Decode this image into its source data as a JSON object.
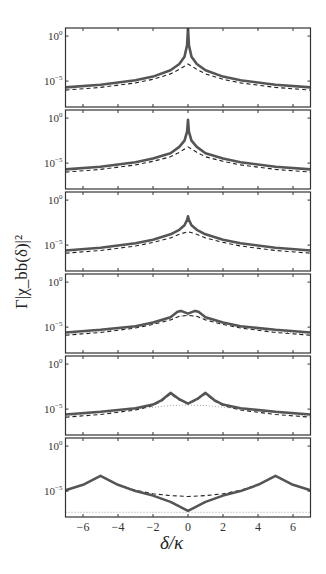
{
  "chart_data": {
    "type": "line",
    "layout": "6 vertically stacked panels sharing x-axis",
    "xlabel": "δ/κ",
    "ylabel": "Γ|χ_bb(δ)|²",
    "xlim": [
      -7,
      7
    ],
    "xticks": [
      -6,
      -4,
      -2,
      0,
      2,
      4,
      6
    ],
    "xtick_labels": [
      "−6",
      "−4",
      "−2",
      "0",
      "2",
      "4",
      "6"
    ],
    "yscale": "log",
    "ylim": [
      1e-08,
      10
    ],
    "yticks": [
      1,
      1e-05
    ],
    "ytick_labels": [
      {
        "base": "10",
        "exp": "0"
      },
      {
        "base": "10",
        "exp": "−5"
      }
    ],
    "grid": false,
    "legend": null,
    "series_styles": {
      "solid": {
        "color": "#555555",
        "width": 2.6,
        "dash": ""
      },
      "dashed": {
        "color": "#222222",
        "width": 1.1,
        "dash": "4,3"
      },
      "dotted": {
        "color": "#999999",
        "width": 0.9,
        "dash": "1,2"
      }
    },
    "panels": [
      {
        "name": "panel-1",
        "series": [
          {
            "name": "solid",
            "x": [
              -7,
              -5,
              -3,
              -2,
              -1,
              -0.5,
              -0.2,
              -0.05,
              0,
              0.05,
              0.2,
              0.5,
              1,
              2,
              3,
              5,
              7
            ],
            "log10_y": [
              -5.7,
              -5.4,
              -4.9,
              -4.5,
              -3.8,
              -3.1,
              -2.3,
              -1.0,
              0.9,
              -1.0,
              -2.3,
              -3.1,
              -3.8,
              -4.5,
              -4.9,
              -5.4,
              -5.7
            ]
          },
          {
            "name": "dashed",
            "x": [
              -7,
              -5,
              -3,
              -2,
              -1,
              -0.5,
              0,
              0.5,
              1,
              2,
              3,
              5,
              7
            ],
            "log10_y": [
              -6.0,
              -5.7,
              -5.2,
              -4.8,
              -4.2,
              -3.7,
              -3.1,
              -3.7,
              -4.2,
              -4.8,
              -5.2,
              -5.7,
              -6.0
            ]
          }
        ]
      },
      {
        "name": "panel-2",
        "series": [
          {
            "name": "solid",
            "x": [
              -7,
              -5,
              -3,
              -2,
              -1,
              -0.5,
              -0.2,
              -0.05,
              0,
              0.05,
              0.2,
              0.5,
              1,
              2,
              3,
              5,
              7
            ],
            "log10_y": [
              -5.7,
              -5.4,
              -4.9,
              -4.5,
              -3.9,
              -3.2,
              -2.5,
              -1.5,
              -0.2,
              -1.5,
              -2.5,
              -3.2,
              -3.9,
              -4.5,
              -4.9,
              -5.4,
              -5.7
            ]
          },
          {
            "name": "dashed",
            "x": [
              -7,
              -5,
              -3,
              -2,
              -1,
              -0.5,
              0,
              0.5,
              1,
              2,
              3,
              5,
              7
            ],
            "log10_y": [
              -6.0,
              -5.7,
              -5.2,
              -4.8,
              -4.3,
              -3.8,
              -3.2,
              -3.8,
              -4.3,
              -4.8,
              -5.2,
              -5.7,
              -6.0
            ]
          }
        ]
      },
      {
        "name": "panel-3",
        "series": [
          {
            "name": "solid",
            "x": [
              -7,
              -5,
              -3,
              -2,
              -1,
              -0.5,
              -0.2,
              -0.05,
              0,
              0.05,
              0.2,
              0.5,
              1,
              2,
              3,
              5,
              7
            ],
            "log10_y": [
              -5.6,
              -5.3,
              -4.8,
              -4.4,
              -3.8,
              -3.3,
              -2.8,
              -2.2,
              -1.8,
              -2.2,
              -2.8,
              -3.3,
              -3.8,
              -4.4,
              -4.8,
              -5.3,
              -5.6
            ]
          },
          {
            "name": "dashed",
            "x": [
              -7,
              -5,
              -3,
              -2,
              -1,
              -0.5,
              0,
              0.5,
              1,
              2,
              3,
              5,
              7
            ],
            "log10_y": [
              -5.9,
              -5.6,
              -5.1,
              -4.7,
              -4.2,
              -3.8,
              -3.5,
              -3.8,
              -4.2,
              -4.7,
              -5.1,
              -5.6,
              -5.9
            ]
          }
        ]
      },
      {
        "name": "panel-4",
        "series": [
          {
            "name": "solid",
            "x": [
              -7,
              -5,
              -3,
              -2,
              -1,
              -0.6,
              -0.4,
              0,
              0.4,
              0.6,
              1,
              2,
              3,
              5,
              7
            ],
            "log10_y": [
              -5.6,
              -5.3,
              -4.9,
              -4.5,
              -3.9,
              -3.3,
              -3.2,
              -3.5,
              -3.2,
              -3.3,
              -3.9,
              -4.5,
              -4.9,
              -5.3,
              -5.6
            ]
          },
          {
            "name": "dashed",
            "x": [
              -7,
              -5,
              -3,
              -2,
              -1,
              -0.5,
              0,
              0.5,
              1,
              2,
              3,
              5,
              7
            ],
            "log10_y": [
              -5.9,
              -5.6,
              -5.1,
              -4.7,
              -4.2,
              -3.8,
              -3.7,
              -3.8,
              -4.2,
              -4.7,
              -5.1,
              -5.6,
              -5.9
            ]
          },
          {
            "name": "dotted",
            "x": [
              -7,
              -5,
              -3,
              -2,
              -1,
              -0.5,
              0,
              0.5,
              1,
              2,
              3,
              5,
              7
            ],
            "log10_y": [
              -5.8,
              -5.5,
              -5.0,
              -4.6,
              -4.1,
              -3.8,
              -3.7,
              -3.8,
              -4.1,
              -4.6,
              -5.0,
              -5.5,
              -5.8
            ]
          }
        ]
      },
      {
        "name": "panel-5",
        "series": [
          {
            "name": "solid",
            "x": [
              -7,
              -5,
              -3,
              -2,
              -1.5,
              -1,
              -0.5,
              0,
              0.5,
              1,
              1.5,
              2,
              3,
              5,
              7
            ],
            "log10_y": [
              -5.6,
              -5.3,
              -4.9,
              -4.5,
              -4.0,
              -3.2,
              -3.9,
              -4.4,
              -3.9,
              -3.2,
              -4.0,
              -4.5,
              -4.9,
              -5.3,
              -5.6
            ]
          },
          {
            "name": "dashed",
            "x": [
              -7,
              -5,
              -3,
              -2,
              -1.5,
              -1,
              -0.5,
              0,
              0.5,
              1,
              1.5,
              2,
              3,
              5,
              7
            ],
            "log10_y": [
              -5.9,
              -5.6,
              -5.1,
              -4.6,
              -4.1,
              -3.3,
              -4.0,
              -4.4,
              -4.0,
              -3.3,
              -4.1,
              -4.6,
              -5.1,
              -5.6,
              -5.9
            ]
          },
          {
            "name": "dotted",
            "x": [
              -7,
              -5,
              -3,
              -2,
              -1,
              0,
              1,
              2,
              3,
              5,
              7
            ],
            "log10_y": [
              -5.8,
              -5.4,
              -5.0,
              -4.8,
              -4.6,
              -4.55,
              -4.6,
              -4.8,
              -5.0,
              -5.4,
              -5.8
            ]
          }
        ]
      },
      {
        "name": "panel-6",
        "series": [
          {
            "name": "solid",
            "x": [
              -7,
              -6,
              -5,
              -4,
              -3,
              -2,
              -1,
              -0.5,
              0,
              0.5,
              1,
              2,
              3,
              4,
              5,
              6,
              7
            ],
            "log10_y": [
              -4.9,
              -4.3,
              -3.3,
              -4.3,
              -5.0,
              -5.5,
              -6.2,
              -6.7,
              -7.2,
              -6.7,
              -6.2,
              -5.5,
              -5.0,
              -4.3,
              -3.3,
              -4.3,
              -4.9
            ]
          },
          {
            "name": "dashed",
            "x": [
              -4,
              -3,
              -2,
              -1,
              0,
              1,
              2,
              3,
              4
            ],
            "log10_y": [
              -4.3,
              -4.9,
              -5.3,
              -5.5,
              -5.6,
              -5.5,
              -5.3,
              -4.9,
              -4.3
            ]
          },
          {
            "name": "dotted",
            "x": [
              -7,
              7
            ],
            "log10_y": [
              -7.35,
              -7.35
            ]
          }
        ]
      }
    ]
  }
}
